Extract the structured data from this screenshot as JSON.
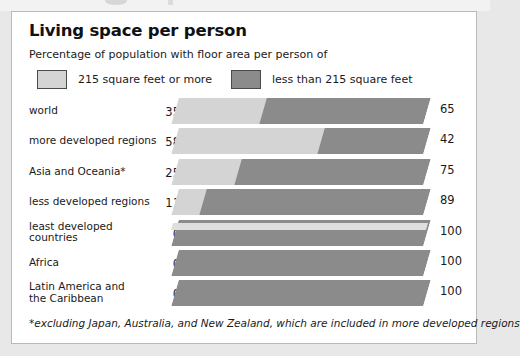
{
  "card": {
    "title": "Living space per person",
    "subtitle": "Percentage of population with floor area per person of",
    "footnote": "*excluding Japan, Australia, and New Zealand, which are included in more developed regions"
  },
  "legend": {
    "entries": [
      {
        "label": "215 square feet or more",
        "swatch_name": "legend-swatch-light",
        "color": "#d4d4d4"
      },
      {
        "label": "less than 215 square feet",
        "swatch_name": "legend-swatch-dark",
        "color": "#8b8b8b"
      }
    ]
  },
  "colors": {
    "light": "#d4d4d4",
    "dark": "#8b8b8b",
    "card_bg": "#ffffff",
    "page_bg": "#e8e8e8",
    "border": "#b9b9b9",
    "text": "#1a1a1a",
    "platform": "#dedede"
  },
  "chart_data": {
    "type": "bar",
    "orientation": "horizontal",
    "stacked": true,
    "normalized": true,
    "title": "Living space per person",
    "subtitle": "Percentage of population with floor area per person of",
    "xlabel": "",
    "ylabel": "",
    "xlim": [
      0,
      100
    ],
    "grid": false,
    "legend_position": "top",
    "categories": [
      "world",
      "more developed regions",
      "Asia and Oceania*",
      "less developed regions",
      "least developed countries",
      "Africa",
      "Latin America and the Caribbean"
    ],
    "series": [
      {
        "name": "215 square feet or more",
        "color": "#d4d4d4",
        "values": [
          35,
          58,
          25,
          11,
          0,
          0,
          0
        ]
      },
      {
        "name": "less than 215 square feet",
        "color": "#8b8b8b",
        "values": [
          65,
          42,
          75,
          89,
          100,
          100,
          100
        ]
      }
    ],
    "annotations": [
      "*excluding Japan, Australia, and New Zealand, which are included in more developed regions"
    ]
  },
  "rows": [
    {
      "label": "world",
      "label_lines": [
        "world"
      ],
      "left": "35",
      "right": "65",
      "light": 35,
      "dark": 65
    },
    {
      "label": "more developed regions",
      "label_lines": [
        "more developed regions"
      ],
      "left": "58",
      "right": "42",
      "light": 58,
      "dark": 42
    },
    {
      "label": "Asia and Oceania*",
      "label_lines": [
        "Asia and Oceania*"
      ],
      "left": "25",
      "right": "75",
      "light": 25,
      "dark": 75
    },
    {
      "label": "less developed regions",
      "label_lines": [
        "less developed regions"
      ],
      "left": "11",
      "right": "89",
      "light": 11,
      "dark": 89
    },
    {
      "label": "least developed countries",
      "label_lines": [
        "least developed",
        "countries"
      ],
      "left": "0",
      "right": "100",
      "light": 0,
      "dark": 100
    },
    {
      "label": "Africa",
      "label_lines": [
        "Africa"
      ],
      "left": "0",
      "right": "100",
      "light": 0,
      "dark": 100
    },
    {
      "label": "Latin America and the Caribbean",
      "label_lines": [
        "Latin America and",
        "the Caribbean"
      ],
      "left": "0",
      "right": "100",
      "light": 0,
      "dark": 100
    }
  ]
}
